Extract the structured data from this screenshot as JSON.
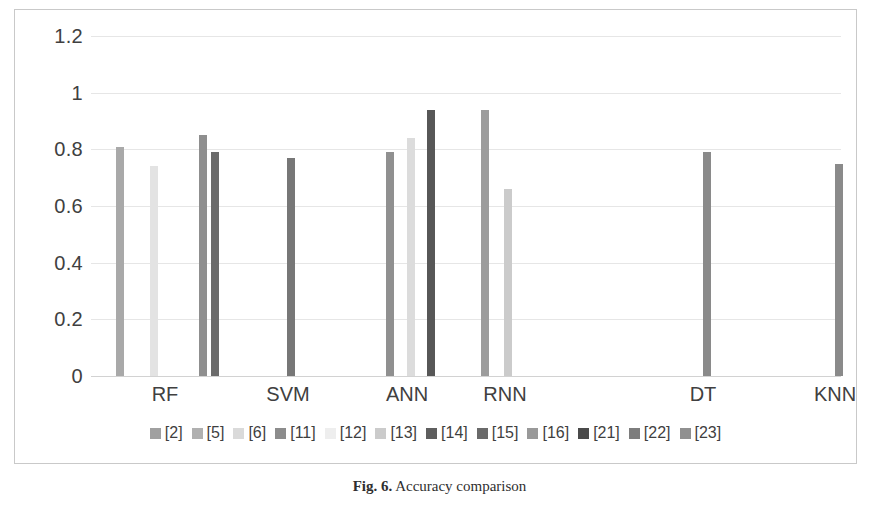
{
  "figure": {
    "caption_label": "Fig. 6.",
    "caption_text": " Accuracy comparison"
  },
  "chart_data": {
    "type": "bar",
    "title": "",
    "xlabel": "",
    "ylabel": "",
    "grid": true,
    "legend_position": "bottom",
    "ylim": [
      0,
      1.2
    ],
    "ytick_labels": [
      "0",
      "0.2",
      "0.4",
      "0.6",
      "0.8",
      "1",
      "1.2"
    ],
    "ytick_values": [
      0,
      0.2,
      0.4,
      0.6,
      0.8,
      1,
      1.2
    ],
    "categories": [
      "RF",
      "SVM",
      "ANN",
      "RNN",
      "DT",
      "KNN"
    ],
    "series": [
      {
        "name": "[2]",
        "color": "#a6a6a6",
        "values": [
          0.81,
          null,
          null,
          null,
          null,
          null
        ]
      },
      {
        "name": "[5]",
        "color": "#b3b3b3",
        "values": [
          null,
          null,
          null,
          null,
          null,
          null
        ]
      },
      {
        "name": "[6]",
        "color": "#dcdcdc",
        "values": [
          0.74,
          null,
          null,
          null,
          null,
          null
        ]
      },
      {
        "name": "[11]",
        "color": "#8c8c8c",
        "values": [
          0.85,
          null,
          null,
          null,
          null,
          null
        ]
      },
      {
        "name": "[12]",
        "color": "#f0f0f0",
        "values": [
          null,
          null,
          null,
          null,
          null,
          null
        ]
      },
      {
        "name": "[13]",
        "color": "#cfcfcf",
        "values": [
          null,
          null,
          null,
          null,
          null,
          null
        ]
      },
      {
        "name": "[14]",
        "color": "#6e6e6e",
        "values": [
          0.79,
          null,
          null,
          null,
          null,
          null
        ]
      },
      {
        "name": "[15]",
        "color": "#5c5c5c",
        "values": [
          null,
          0.77,
          null,
          null,
          null,
          null
        ]
      },
      {
        "name": "[16]",
        "color": "#9a9a9a",
        "values": [
          null,
          null,
          0.79,
          0.94,
          null,
          null
        ]
      },
      {
        "name": "[21]",
        "color": "#4d4d4d",
        "values": [
          null,
          null,
          0.94,
          null,
          null,
          null
        ]
      },
      {
        "name": "[22]",
        "color": "#858585",
        "values": [
          null,
          null,
          null,
          null,
          0.79,
          0.75
        ]
      },
      {
        "name": "[23]",
        "color": "#a0a0a0",
        "values": [
          null,
          null,
          null,
          null,
          null,
          null
        ]
      },
      {
        "name": "[24]",
        "color": "#e2e2e2",
        "values": [
          null,
          null,
          0.84,
          0.66,
          null,
          null
        ]
      }
    ],
    "bars": [
      {
        "group": "RF",
        "series": "[2]",
        "value": 0.81,
        "color": "#a9a9a9",
        "x": 101
      },
      {
        "group": "RF",
        "series": "[6]",
        "value": 0.74,
        "color": "#e3e3e3",
        "x": 135
      },
      {
        "group": "RF",
        "series": "[11]",
        "value": 0.85,
        "color": "#8f8f8f",
        "x": 184
      },
      {
        "group": "RF",
        "series": "[14]",
        "value": 0.79,
        "color": "#6b6b6b",
        "x": 196
      },
      {
        "group": "SVM",
        "series": "[15]",
        "value": 0.77,
        "color": "#777777",
        "x": 272
      },
      {
        "group": "ANN",
        "series": "[16]",
        "value": 0.79,
        "color": "#909090",
        "x": 371
      },
      {
        "group": "ANN",
        "series": "[24]",
        "value": 0.84,
        "color": "#dcdcdc",
        "x": 392
      },
      {
        "group": "ANN",
        "series": "[21]",
        "value": 0.94,
        "color": "#575757",
        "x": 412
      },
      {
        "group": "RNN",
        "series": "[16]",
        "value": 0.94,
        "color": "#9c9c9c",
        "x": 466
      },
      {
        "group": "RNN",
        "series": "[24]",
        "value": 0.66,
        "color": "#cbcbcb",
        "x": 489
      },
      {
        "group": "DT",
        "series": "[22]",
        "value": 0.79,
        "color": "#8a8a8a",
        "x": 688
      },
      {
        "group": "KNN",
        "series": "[22]",
        "value": 0.75,
        "color": "#8a8a8a",
        "x": 820
      }
    ],
    "legend": [
      {
        "label": "[2]",
        "color": "#a0a0a0"
      },
      {
        "label": "[5]",
        "color": "#b0b0b0"
      },
      {
        "label": "[6]",
        "color": "#dadada"
      },
      {
        "label": "[11]",
        "color": "#8c8c8c"
      },
      {
        "label": "[12]",
        "color": "#eeeeee"
      },
      {
        "label": "[13]",
        "color": "#cbcbcb"
      },
      {
        "label": "[14]",
        "color": "#5e5e5e"
      },
      {
        "label": "[15]",
        "color": "#6a6a6a"
      },
      {
        "label": "[16]",
        "color": "#999999"
      },
      {
        "label": "[21]",
        "color": "#4a4a4a"
      },
      {
        "label": "[22]",
        "color": "#7d7d7d"
      },
      {
        "label": "[23]",
        "color": "#909090"
      }
    ]
  }
}
